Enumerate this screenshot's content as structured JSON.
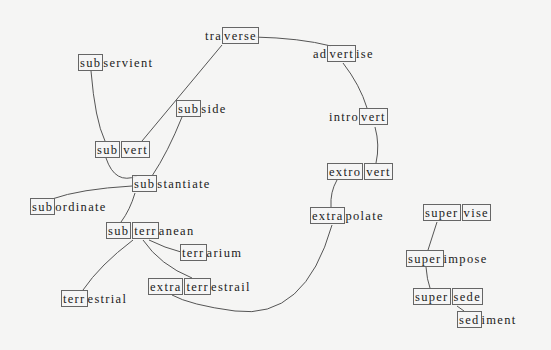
{
  "diagram": {
    "type": "morpheme-network",
    "nodes": {
      "traverse": {
        "segments": [
          "tra",
          "verse"
        ],
        "boxed": [
          1
        ]
      },
      "subservient": {
        "segments": [
          "sub",
          "servient"
        ],
        "boxed": [
          0
        ]
      },
      "subvert": {
        "segments": [
          "sub",
          "vert"
        ],
        "boxed": [
          0,
          1
        ]
      },
      "subside": {
        "segments": [
          "sub",
          "side"
        ],
        "boxed": [
          0
        ]
      },
      "substantiate": {
        "segments": [
          "sub",
          "stantiate"
        ],
        "boxed": [
          0
        ]
      },
      "subordinate": {
        "segments": [
          "sub",
          "ordinate"
        ],
        "boxed": [
          0
        ]
      },
      "subterranean": {
        "segments": [
          "sub",
          "terr",
          "anean"
        ],
        "boxed": [
          0,
          1
        ]
      },
      "terrarium": {
        "segments": [
          "terr",
          "arium"
        ],
        "boxed": [
          0
        ]
      },
      "extraterrestrail": {
        "segments": [
          "extra",
          "terr",
          "estrail"
        ],
        "boxed": [
          0,
          1
        ]
      },
      "terrestrial": {
        "segments": [
          "terr",
          "estrial"
        ],
        "boxed": [
          0
        ]
      },
      "advertise": {
        "segments": [
          "ad",
          "vert",
          "ise"
        ],
        "boxed": [
          1
        ]
      },
      "introvert": {
        "segments": [
          "intro",
          "vert"
        ],
        "boxed": [
          1
        ]
      },
      "extrovert": {
        "segments": [
          "extro",
          "vert"
        ],
        "boxed": [
          0,
          1
        ]
      },
      "extrapolate": {
        "segments": [
          "extra",
          "polate"
        ],
        "boxed": [
          0
        ]
      },
      "supervise": {
        "segments": [
          "super",
          "vise"
        ],
        "boxed": [
          0,
          1
        ]
      },
      "superimpose": {
        "segments": [
          "super",
          "impose"
        ],
        "boxed": [
          0
        ]
      },
      "supersede": {
        "segments": [
          "super",
          "sede"
        ],
        "boxed": [
          0,
          1
        ]
      },
      "sediment": {
        "segments": [
          "sed",
          "iment"
        ],
        "boxed": [
          0
        ]
      }
    },
    "edges": [
      [
        "traverse",
        "subvert"
      ],
      [
        "traverse",
        "advertise"
      ],
      [
        "subservient",
        "subvert"
      ],
      [
        "subvert",
        "substantiate"
      ],
      [
        "subside",
        "substantiate"
      ],
      [
        "substantiate",
        "subordinate"
      ],
      [
        "substantiate",
        "subterranean"
      ],
      [
        "subterranean",
        "terrarium"
      ],
      [
        "subterranean",
        "extraterrestrail"
      ],
      [
        "subterranean",
        "terrestrial"
      ],
      [
        "advertise",
        "introvert"
      ],
      [
        "introvert",
        "extrovert"
      ],
      [
        "extrovert",
        "extrapolate"
      ],
      [
        "extrapolate",
        "extraterrestrail"
      ],
      [
        "supervise",
        "superimpose"
      ],
      [
        "superimpose",
        "supersede"
      ],
      [
        "supersede",
        "sediment"
      ]
    ],
    "colors": {
      "background": "#f5f5f4",
      "edge": "#555555",
      "box": "#666666",
      "text": "#222222"
    }
  }
}
